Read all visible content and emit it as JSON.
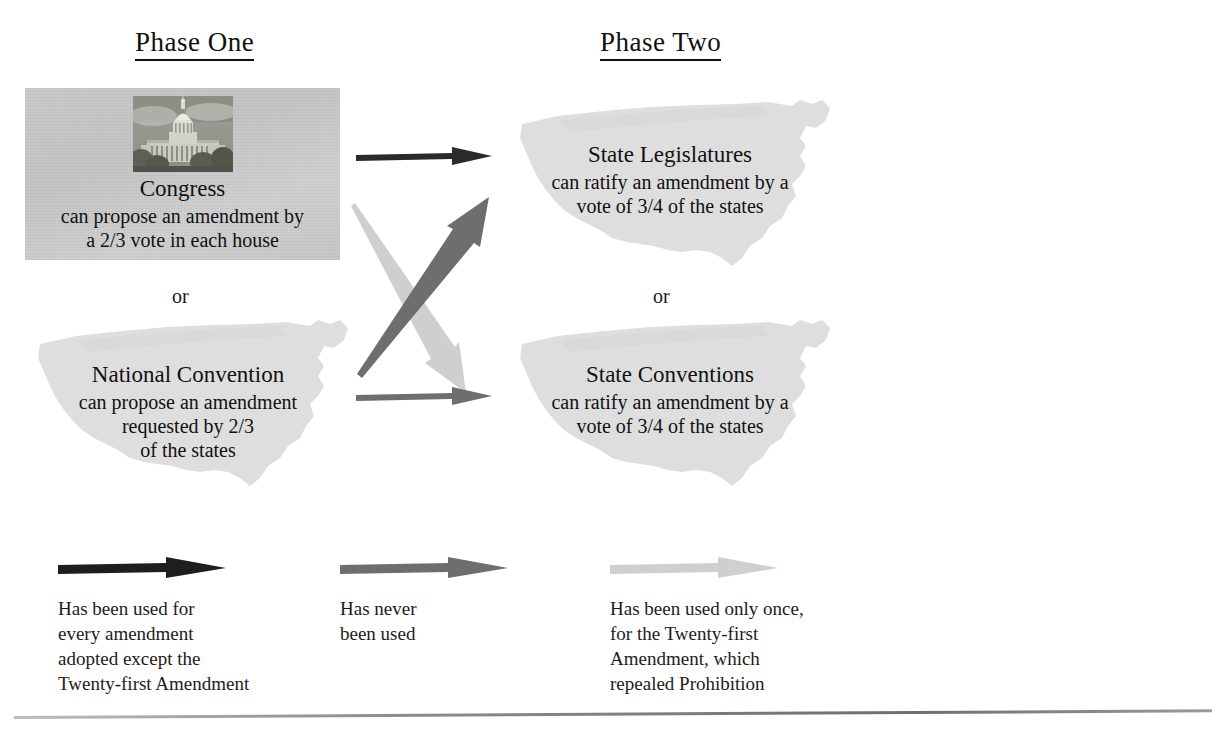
{
  "diagram": {
    "phases": {
      "one": "Phase  One",
      "two": "Phase  Two"
    },
    "connectors": {
      "or_left": "or",
      "or_right": "or"
    },
    "nodes": {
      "congress": {
        "title": "Congress",
        "line1": "can propose an amendment by",
        "line2": "a  2/3  vote in each house",
        "image": "us-capitol-photo",
        "box_color": "#c7c7c7"
      },
      "national_convention": {
        "title": "National  Convention",
        "line1": "can propose an amendment",
        "line2": "requested by 2/3",
        "line3": "of the states",
        "shape": "us-map-silhouette",
        "shape_color": "#dedede"
      },
      "state_legislatures": {
        "title": "State  Legislatures",
        "line1": "can ratify an amendment by a",
        "line2": "vote of 3/4 of the states",
        "shape": "us-map-silhouette",
        "shape_color": "#dedede"
      },
      "state_conventions": {
        "title": "State  Conventions",
        "line1": "can ratify an amendment by a",
        "line2": "vote of 3/4 of the states",
        "shape": "us-map-silhouette",
        "shape_color": "#dedede"
      }
    },
    "arrows": [
      {
        "name": "congress-to-state-legislatures",
        "style": "black",
        "color": "#2a2a2a",
        "from": "congress",
        "to": "state_legislatures"
      },
      {
        "name": "national-convention-to-state-legislatures",
        "style": "dark-gray",
        "color": "#6e6e6e",
        "from": "national_convention",
        "to": "state_legislatures"
      },
      {
        "name": "congress-to-state-conventions",
        "style": "light-gray",
        "color": "#cfcfcf",
        "from": "congress",
        "to": "state_conventions"
      },
      {
        "name": "national-convention-to-state-conventions",
        "style": "dark-gray",
        "color": "#6e6e6e",
        "from": "national_convention",
        "to": "state_conventions"
      }
    ]
  },
  "legend": [
    {
      "arrow_style": "black",
      "color": "#1e1e1e",
      "line1": "Has been used for",
      "line2": "every amendment",
      "line3": "adopted except the",
      "line4": "Twenty-first Amendment"
    },
    {
      "arrow_style": "dark-gray",
      "color": "#6e6e6e",
      "line1": "Has never",
      "line2": "been used",
      "line3": "",
      "line4": ""
    },
    {
      "arrow_style": "light-gray",
      "color": "#cfcfcf",
      "line1": "Has been used only once,",
      "line2": "for the Twenty-first",
      "line3": "Amendment, which",
      "line4": "repealed Prohibition"
    }
  ]
}
